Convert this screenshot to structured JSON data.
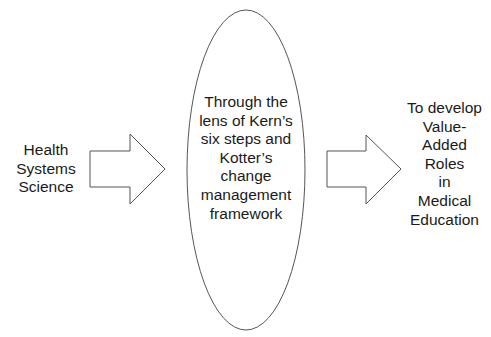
{
  "diagram": {
    "input": {
      "lines": [
        "Health",
        "Systems",
        "Science"
      ]
    },
    "process": {
      "shape": "ellipse",
      "lines": [
        "Through the",
        "lens of Kern’s",
        "six steps and",
        "Kotter’s",
        "change",
        "management",
        "framework"
      ]
    },
    "output": {
      "lines": [
        "To develop",
        "Value-",
        "Added",
        "Roles",
        "in",
        "Medical",
        "Education"
      ]
    },
    "arrows": [
      {
        "from": "input",
        "to": "process",
        "icon": "block-arrow-right"
      },
      {
        "from": "process",
        "to": "output",
        "icon": "block-arrow-right"
      }
    ],
    "colors": {
      "stroke": "#555555",
      "fill": "#ffffff",
      "text": "#1a1a1a"
    }
  }
}
